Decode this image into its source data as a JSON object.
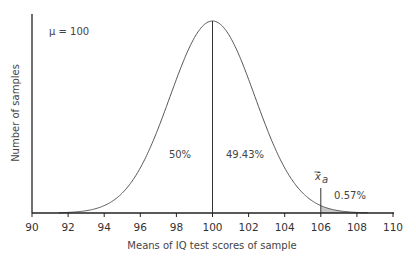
{
  "chart_data": {
    "type": "line",
    "title": "",
    "annotation_mu": "μ = 100",
    "xlabel": "Means of IQ test scores of sample",
    "ylabel": "Number of samples",
    "x_ticks": [
      "90",
      "92",
      "94",
      "96",
      "98",
      "100",
      "102",
      "104",
      "106",
      "108",
      "110"
    ],
    "xlim": [
      90,
      110
    ],
    "mean": 100,
    "sd": 2.35,
    "curve": "normal distribution of sample means",
    "regions": [
      {
        "label": "50%",
        "from": 90,
        "to": 100
      },
      {
        "label": "49.43%",
        "from": 100,
        "to": 106
      },
      {
        "label": "0.57%",
        "from": 106,
        "to": 110,
        "shaded": true
      }
    ],
    "marker": {
      "label": "x̄",
      "subscript": "a",
      "x": 106
    },
    "vertical_lines": [
      100,
      106
    ],
    "grid": false,
    "legend": null
  },
  "colors": {
    "axis": "#222222",
    "curve": "#555555",
    "shade": "#c8c8c8",
    "text": "#444444"
  }
}
